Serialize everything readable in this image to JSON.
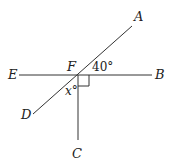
{
  "diagram": {
    "type": "geometry",
    "points": {
      "A": "A",
      "B": "B",
      "C": "C",
      "D": "D",
      "E": "E",
      "F": "F"
    },
    "angles": {
      "angle_AFB": "40°",
      "angle_DFC": "x°",
      "angle_BFC": "right angle"
    },
    "lines": [
      "EB",
      "AD",
      "FC"
    ]
  }
}
